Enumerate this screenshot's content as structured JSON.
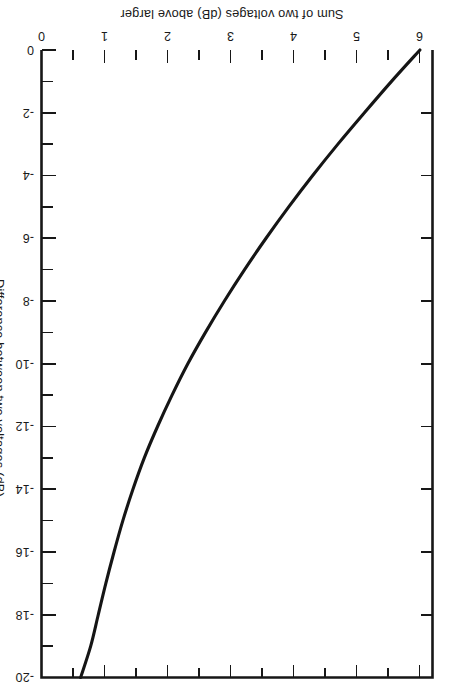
{
  "figure": {
    "rotation_degrees": 180,
    "background_color": "#ffffff",
    "ink_color": "#171717"
  },
  "chart_data": {
    "type": "line",
    "title": "",
    "xlabel": "Difference between two voltages (dB)",
    "ylabel": "Sum of two voltages (dB) above larger",
    "xlim": [
      0,
      -20
    ],
    "ylim": [
      0,
      6.2
    ],
    "grid": false,
    "legend": "none",
    "x_major_ticks": [
      0,
      -2,
      -4,
      -6,
      -8,
      -10,
      -12,
      -14,
      -16,
      -18,
      -20
    ],
    "x_major_tick_labels": [
      "0",
      "-2",
      "-4",
      "-6",
      "-8",
      "-10",
      "-12",
      "-14",
      "-16",
      "-18",
      "-20"
    ],
    "x_minor_ticks": [
      -1,
      -3,
      -5,
      -7,
      -9,
      -11,
      -13,
      -15,
      -17,
      -19
    ],
    "y_major_ticks": [
      0,
      1,
      2,
      3,
      4,
      5,
      6
    ],
    "y_major_tick_labels": [
      "0",
      "1",
      "2",
      "3",
      "4",
      "5",
      "6"
    ],
    "y_minor_ticks": [
      0.5,
      1.5,
      2.5,
      3.5,
      4.5,
      5.5
    ],
    "series": [
      {
        "name": "Sum of two voltages above larger",
        "formula": "10*log10(1 + 10^(d/10))",
        "x": [
          0,
          -0.5,
          -1,
          -1.5,
          -2,
          -2.5,
          -3,
          -3.5,
          -4,
          -4.5,
          -5,
          -5.5,
          -6,
          -6.5,
          -7,
          -7.5,
          -8,
          -8.5,
          -9,
          -9.5,
          -10,
          -11,
          -12,
          -13,
          -14,
          -15,
          -16,
          -17,
          -18,
          -19,
          -20
        ],
        "y": [
          3.01,
          2.77,
          2.54,
          2.32,
          2.12,
          1.94,
          1.76,
          1.6,
          1.46,
          1.32,
          1.19,
          1.08,
          0.97,
          0.88,
          0.79,
          0.71,
          0.64,
          0.57,
          0.51,
          0.46,
          0.41,
          0.33,
          0.27,
          0.21,
          0.17,
          0.14,
          0.11,
          0.086,
          0.069,
          0.054,
          0.043
        ]
      }
    ],
    "curve_display": {
      "note": "Plotted curve is the mirrored reading: value 6 at difference 0 falling to ~0.6 at -20 dB as drawn on the page",
      "x": [
        0,
        -1,
        -2,
        -3,
        -4,
        -5,
        -6,
        -7,
        -8,
        -9,
        -10,
        -11,
        -12,
        -13,
        -14,
        -15,
        -16,
        -17,
        -18,
        -19,
        -20
      ],
      "y": [
        6.0,
        5.55,
        5.12,
        4.7,
        4.3,
        3.92,
        3.56,
        3.22,
        2.9,
        2.6,
        2.32,
        2.07,
        1.84,
        1.63,
        1.45,
        1.29,
        1.15,
        1.02,
        0.9,
        0.78,
        0.62
      ]
    }
  }
}
